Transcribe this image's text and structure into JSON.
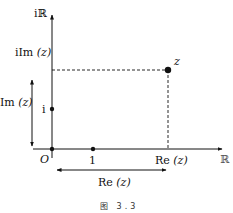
{
  "diagram": {
    "caption": "图 3.3",
    "axes": {
      "imaginary_axis_label": "iℝ",
      "real_axis_label": "ℝ",
      "origin_label": "O"
    },
    "points": {
      "one": {
        "label": "1"
      },
      "i": {
        "label": "i"
      },
      "z": {
        "label": "z"
      }
    },
    "annotations": {
      "i_im_z": {
        "prefix": "iIm",
        "arg": "(z)"
      },
      "im_z": {
        "prefix": "Im",
        "arg": "(z)"
      },
      "re_z_tick": {
        "prefix": "Re",
        "arg": "(z)"
      },
      "re_z_width": {
        "prefix": "Re",
        "arg": "(z)"
      }
    },
    "colors": {
      "line": "#111111",
      "background": "#ffffff"
    }
  }
}
